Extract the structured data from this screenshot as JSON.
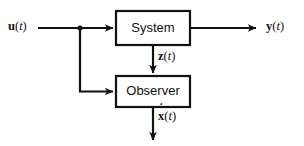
{
  "diagram": {
    "type": "block-diagram",
    "background_color": "#ffffff",
    "line_color": "#111111",
    "blocks": [
      {
        "id": "system",
        "label": "System",
        "x": 116,
        "y": 11,
        "width": 74,
        "height": 34
      },
      {
        "id": "observer",
        "label": "Observer",
        "x": 116,
        "y": 76,
        "width": 74,
        "height": 31
      }
    ],
    "signals": [
      {
        "id": "u",
        "text": "u(t)",
        "bold_part": "u",
        "italic_part": "t",
        "diacritic": "",
        "role": "input",
        "x": 8,
        "y": 20
      },
      {
        "id": "y",
        "text": "y(t)",
        "bold_part": "y",
        "italic_part": "t",
        "diacritic": "",
        "role": "output",
        "x": 266,
        "y": 20
      },
      {
        "id": "z",
        "text": "z(t)",
        "bold_part": "z",
        "italic_part": "t",
        "diacritic": "",
        "role": "internal",
        "x": 158,
        "y": 50
      },
      {
        "id": "xhat",
        "text": "x(t)",
        "bold_part": "x",
        "italic_part": "t",
        "diacritic": "˙",
        "role": "estimate",
        "x": 158,
        "y": 110
      }
    ],
    "connections": [
      {
        "id": "u-to-system",
        "from": "u-input",
        "to": "system-left"
      },
      {
        "id": "u-branch-to-observer",
        "from": "u-branch",
        "to": "observer-left"
      },
      {
        "id": "system-to-y",
        "from": "system-right",
        "to": "y-output"
      },
      {
        "id": "system-to-observer",
        "from": "system-bottom",
        "to": "observer-top"
      },
      {
        "id": "observer-to-xhat",
        "from": "observer-bottom",
        "to": "xhat-output"
      }
    ]
  }
}
